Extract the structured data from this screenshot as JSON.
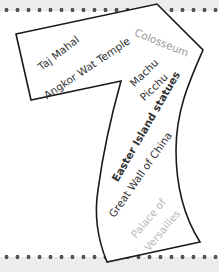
{
  "title_shape": "7",
  "colors": {
    "background_band": "#ececec",
    "paper": "#ffffff",
    "outline": "#1a1a1a",
    "text_dark": "#333333",
    "text_light": "#9a9a9a",
    "text_lighter": "#b8b8b8",
    "dots": "#555555"
  },
  "wonders": [
    {
      "label": "Taj Mahal"
    },
    {
      "label": "Angkor Wat Temple"
    },
    {
      "label": "Colosseum"
    },
    {
      "label": "Machu"
    },
    {
      "label": "Picchu"
    },
    {
      "label": "Easter Island statues"
    },
    {
      "label": "Great Wall of China"
    },
    {
      "label": "Palace of"
    },
    {
      "label": "Versailles"
    }
  ]
}
